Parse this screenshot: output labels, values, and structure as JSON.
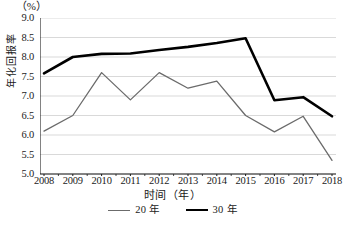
{
  "chart_data": {
    "type": "line",
    "title": "",
    "unit_label": "（%）",
    "xlabel": "时间（年）",
    "ylabel": "年化回报率",
    "categories": [
      "2008",
      "2009",
      "2010",
      "2011",
      "2012",
      "2013",
      "2014",
      "2015",
      "2016",
      "2017",
      "2018"
    ],
    "ylim": [
      5.0,
      9.0
    ],
    "ytick_labels": [
      "9.0",
      "8.5",
      "8.0",
      "7.5",
      "7.0",
      "6.5",
      "6.0",
      "5.5",
      "5.0"
    ],
    "ytick_values": [
      9.0,
      8.5,
      8.0,
      7.5,
      7.0,
      6.5,
      6.0,
      5.5,
      5.0
    ],
    "grid": true,
    "legend_position": "bottom",
    "series": [
      {
        "name": "20 年",
        "color": "#6b6b6b",
        "width": 1.3,
        "values": [
          6.1,
          6.5,
          7.6,
          6.9,
          7.6,
          7.2,
          7.38,
          6.5,
          6.08,
          6.48,
          5.35
        ]
      },
      {
        "name": "30 年",
        "color": "#000000",
        "width": 2.6,
        "values": [
          7.58,
          8.0,
          8.08,
          8.09,
          8.18,
          8.26,
          8.36,
          8.48,
          6.89,
          6.97,
          6.48
        ]
      }
    ]
  }
}
